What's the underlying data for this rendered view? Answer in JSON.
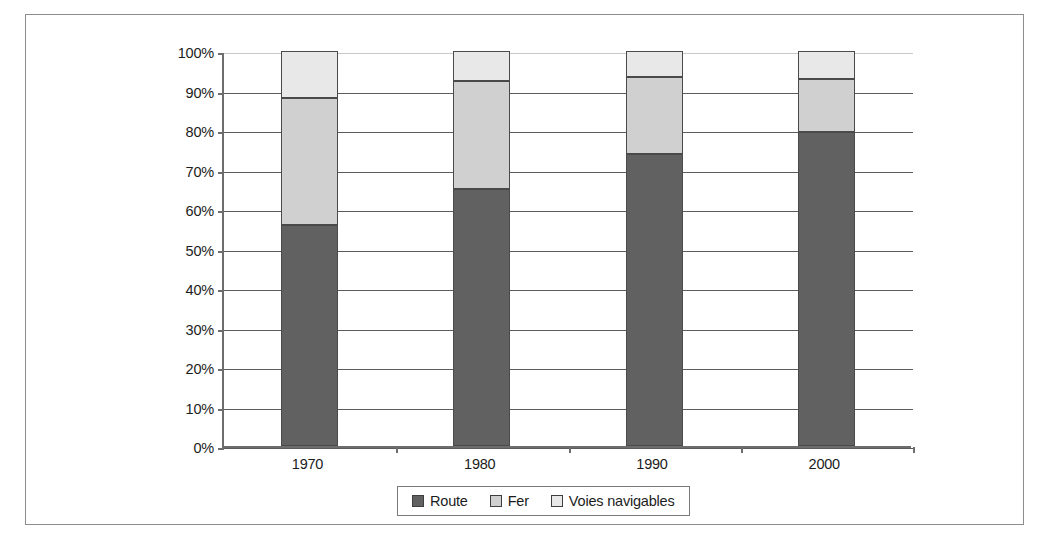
{
  "chart_data": {
    "type": "bar",
    "subtype": "100% stacked column",
    "title": "",
    "subtitle": "",
    "xlabel": "",
    "ylabel": "",
    "categories": [
      "1970",
      "1980",
      "1990",
      "2000"
    ],
    "series": [
      {
        "name": "Route",
        "color": "#616161",
        "values": [
          56.0,
          65.0,
          74.0,
          79.5
        ]
      },
      {
        "name": "Fer",
        "color": "#d0d0d0",
        "values": [
          32.0,
          27.5,
          19.5,
          13.5
        ]
      },
      {
        "name": "Voies navigables",
        "color": "#e8e8e8",
        "values": [
          12.0,
          7.5,
          6.5,
          7.0
        ]
      }
    ],
    "ylim": [
      0,
      100
    ],
    "ytick_values": [
      0,
      10,
      20,
      30,
      40,
      50,
      60,
      70,
      80,
      90,
      100
    ],
    "ytick_labels": [
      "0%",
      "10%",
      "20%",
      "30%",
      "40%",
      "50%",
      "60%",
      "70%",
      "80%",
      "90%",
      "100%"
    ],
    "grid": true,
    "grid_axis": "y",
    "legend_position": "bottom",
    "legend_entries": [
      "Route",
      "Fer",
      "Voies navigables"
    ]
  },
  "legend": {
    "items": [
      {
        "label": "Route"
      },
      {
        "label": "Fer"
      },
      {
        "label": "Voies navigables"
      }
    ]
  },
  "colors": {
    "route": "#616161",
    "fer": "#d0d0d0",
    "voies_navigables": "#e8e8e8",
    "gridline": "#5c5c5c",
    "axis": "#6d6d6d",
    "frame": "#8d8d8d",
    "text": "#1c1c1c"
  }
}
